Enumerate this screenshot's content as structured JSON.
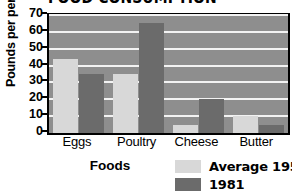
{
  "chart_data": {
    "type": "bar",
    "title": "FOOD CONSUMPTION",
    "xlabel": "Foods",
    "ylabel": "Pounds per person (yearly)",
    "categories": [
      "Eggs",
      "Poultry",
      "Cheese",
      "Butter"
    ],
    "series": [
      {
        "name": "Average 1957–59",
        "color": "#d8d8d8",
        "values": [
          44,
          35,
          5,
          10
        ]
      },
      {
        "name": "1981",
        "color": "#6b6b6b",
        "values": [
          35,
          65,
          20,
          5
        ]
      }
    ],
    "ylim": [
      0,
      70
    ],
    "yticks": [
      0,
      10,
      20,
      30,
      40,
      50,
      60,
      70
    ],
    "ytick_labels": [
      "0",
      "10",
      "20",
      "30",
      "40",
      "50",
      "60",
      "70"
    ],
    "grid": true,
    "grid_color": "#f2f2f2",
    "plot_background": "#8e8e8e",
    "legend_position": "bottom-right"
  }
}
